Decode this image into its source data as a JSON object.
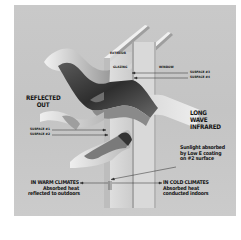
{
  "diagram": {
    "title_hidden": "Low-E glazing heat transfer",
    "colors": {
      "background": "#c7c7c7",
      "ribbon_dark": "#3a3a3a",
      "ribbon_light": "#e6e6e6",
      "glass": "#d8d8d8",
      "text": "#141414",
      "arrow": "#2a2a2a"
    },
    "labels": {
      "exterior": "EXTERIOR",
      "glazing": "GLAZING",
      "window": "WINDOW",
      "surface3": "SURFACE #3",
      "surface4": "SURFACE #4",
      "reflected_out_line1": "REFLECTED",
      "reflected_out_line2": "OUT",
      "surface1": "SURFACE #1",
      "surface2": "SURFACE #2",
      "long_wave_line1": "LONG",
      "long_wave_line2": "WAVE",
      "long_wave_line3": "INFRARED",
      "sunlight_line1": "Sunlight absorbed",
      "sunlight_line2": "by Low E coating",
      "sunlight_line3": "on #2 surface",
      "warm_title": "IN WARM CLIMATES",
      "warm_line1": "Absorbed heat",
      "warm_line2": "reflected to outdoors",
      "cold_title": "IN COLD CLIMATES",
      "cold_line1": "Absorbed heat",
      "cold_line2": "conducted indoors"
    }
  }
}
